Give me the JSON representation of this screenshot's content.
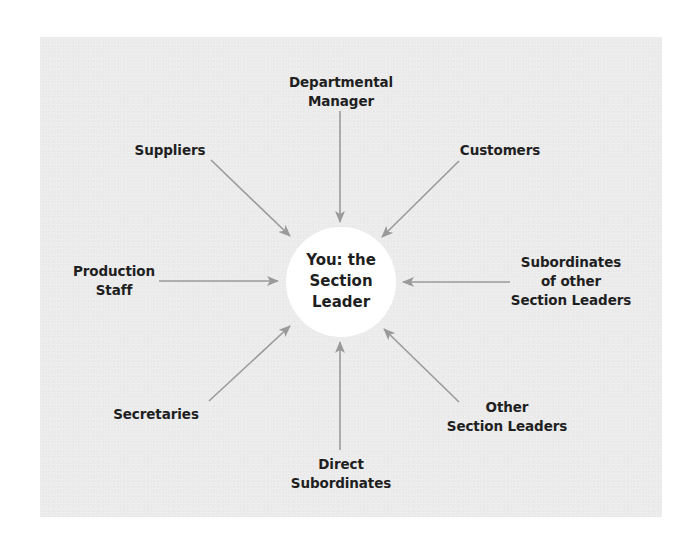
{
  "clipped_header": {
    "text": "",
    "note_visible": "partially cut-off text at top-right edge"
  },
  "diagram": {
    "type": "hub-and-spoke",
    "center": {
      "label": "You: the\nSection\nLeader"
    },
    "nodes": [
      {
        "id": "departmental-manager",
        "label": "Departmental\nManager",
        "position": "top"
      },
      {
        "id": "customers",
        "label": "Customers",
        "position": "top-right"
      },
      {
        "id": "subordinates-of-other-section-leaders",
        "label": "Subordinates\nof other\nSection Leaders",
        "position": "right"
      },
      {
        "id": "other-section-leaders",
        "label": "Other\nSection Leaders",
        "position": "bottom-right"
      },
      {
        "id": "direct-subordinates",
        "label": "Direct\nSubordinates",
        "position": "bottom"
      },
      {
        "id": "secretaries",
        "label": "Secretaries",
        "position": "bottom-left"
      },
      {
        "id": "production-staff",
        "label": "Production\nStaff",
        "position": "left"
      },
      {
        "id": "suppliers",
        "label": "Suppliers",
        "position": "top-left"
      }
    ],
    "edges": [
      {
        "from": "departmental-manager",
        "to": "center",
        "arrow": "to-center"
      },
      {
        "from": "customers",
        "to": "center",
        "arrow": "to-center"
      },
      {
        "from": "subordinates-of-other-section-leaders",
        "to": "center",
        "arrow": "to-center"
      },
      {
        "from": "other-section-leaders",
        "to": "center",
        "arrow": "to-center"
      },
      {
        "from": "direct-subordinates",
        "to": "center",
        "arrow": "to-center"
      },
      {
        "from": "secretaries",
        "to": "center",
        "arrow": "to-center"
      },
      {
        "from": "production-staff",
        "to": "center",
        "arrow": "to-center"
      },
      {
        "from": "suppliers",
        "to": "center",
        "arrow": "to-center"
      }
    ],
    "colors": {
      "panel_background": "#ebebeb",
      "arrow": "#9a9a9a",
      "center_fill": "#ffffff",
      "text": "#1f1f1f"
    }
  }
}
